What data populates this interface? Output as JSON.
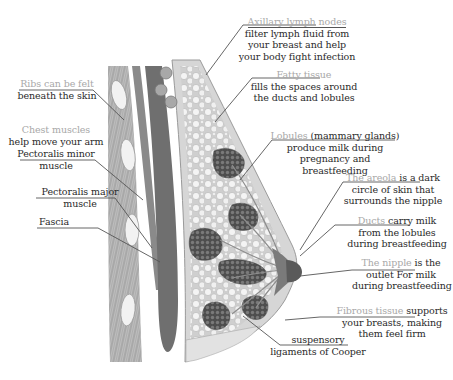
{
  "diagram": {
    "palette": {
      "background": "#ffffff",
      "label_term": "#a8a8a8",
      "label_text": "#2a2a2a",
      "muscle": "#6a6a6a",
      "tissue": "#d8d8d8",
      "lobule": "#5a5a5a",
      "leader": "#555555"
    },
    "labels": {
      "axillary": {
        "term": "Axillary lymph nodes",
        "lines": [
          "filter lymph fluid  from",
          "your breast and help",
          "your body fight infection"
        ]
      },
      "ribs": {
        "term": "Ribs can be felt",
        "lines": [
          "beneath the skin"
        ]
      },
      "chest_muscles": {
        "term": "Chest muscles",
        "lines": [
          "help move your arm"
        ]
      },
      "pec_minor": {
        "lines": [
          "Pectoralis minor",
          "muscle"
        ]
      },
      "pec_major": {
        "lines": [
          "Pectoralis major",
          "muscle"
        ]
      },
      "fascia": {
        "lines": [
          "Fascia"
        ]
      },
      "fatty": {
        "term": "Fatty tissue",
        "lines": [
          "fills the spaces around",
          "the ducts and lobules"
        ]
      },
      "lobules": {
        "term": "Lobules",
        "term_suffix": " (mammary glands)",
        "lines": [
          "produce milk during",
          "pregnancy and",
          "breastfeeding"
        ]
      },
      "areola": {
        "term": "The areola",
        "term_suffix": " is a dark",
        "lines": [
          "circle of skin that",
          "surrounds the nipple"
        ]
      },
      "ducts": {
        "term": "Ducts",
        "term_suffix": " carry milk",
        "lines": [
          "from the lobules",
          "during breastfeeding"
        ]
      },
      "nipple": {
        "term": "The nipple",
        "term_suffix": " is the",
        "lines": [
          "outlet For milk",
          "during breastfeeding"
        ]
      },
      "fibrous": {
        "term": "Fibrous tissue",
        "term_suffix": " supports",
        "lines": [
          "your breasts, making",
          "them feel firm"
        ]
      },
      "cooper": {
        "lines": [
          "suspensory",
          "ligaments of Cooper"
        ]
      }
    }
  }
}
